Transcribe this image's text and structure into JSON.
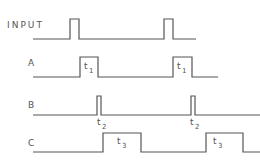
{
  "diagram": {
    "type": "timing-diagram",
    "stroke_color": "#555555",
    "signals": [
      {
        "name": "INPUT",
        "label": "INPUT",
        "baseline_y": 39,
        "high_y": 19,
        "points": "33,39 70,39 70,19 79,19 79,39 164,39 164,19 173,19 173,39 196,39",
        "annotations": []
      },
      {
        "name": "A",
        "label": "A",
        "baseline_y": 77,
        "high_y": 57,
        "points": "33,77 80,77 80,57 98,57 98,77 173,77 173,57 192,57 192,77 218,77",
        "annotations": [
          {
            "text": "t",
            "sub": "1",
            "x": 84,
            "y": 71
          },
          {
            "text": "t",
            "sub": "1",
            "x": 177,
            "y": 71
          }
        ]
      },
      {
        "name": "B",
        "label": "B",
        "baseline_y": 115,
        "high_y": 96,
        "points": "33,115 97,115 97,96 101,96 101,115 191,115 191,96 195,96 195,115 260,115",
        "annotations": [
          {
            "text": "t",
            "sub": "2",
            "x": 97,
            "y": 125
          },
          {
            "text": "t",
            "sub": "2",
            "x": 190,
            "y": 125
          }
        ]
      },
      {
        "name": "C",
        "label": "C",
        "baseline_y": 152,
        "high_y": 133,
        "points": "33,152 103,152 103,133 141,133 141,152 206,152 206,133 243,133 243,152 260,152",
        "annotations": [
          {
            "text": "t",
            "sub": "3",
            "x": 116,
            "y": 147
          },
          {
            "text": "t",
            "sub": "3",
            "x": 212,
            "y": 147
          }
        ]
      }
    ]
  }
}
